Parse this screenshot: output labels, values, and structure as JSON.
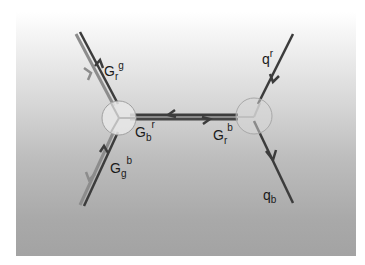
{
  "diagram": {
    "type": "feynman-gluon-exchange",
    "labels": {
      "top_left": {
        "main": "G",
        "sub": "r",
        "sup": "g"
      },
      "bottom_left": {
        "main": "G",
        "sub": "g",
        "sup": "b"
      },
      "middle_left": {
        "main": "G",
        "sub": "b",
        "sup": "r"
      },
      "middle_right": {
        "main": "G",
        "sub": "r",
        "sup": "b"
      },
      "top_right": {
        "main": "q",
        "sup": "r"
      },
      "bottom_right": {
        "main": "q",
        "sub": "b"
      }
    },
    "vertices": [
      {
        "name": "left-vertex",
        "cx": 119,
        "cy": 118,
        "r": 17
      },
      {
        "name": "right-vertex",
        "cx": 254,
        "cy": 116,
        "r": 18
      }
    ],
    "colors": {
      "line_dark": "#3a3a3a",
      "line_light": "#8a8a8a",
      "vertex_fill": "#e6e6e6",
      "vertex_stroke": "#9a9a9a"
    }
  }
}
